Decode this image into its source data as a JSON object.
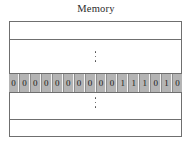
{
  "figure": {
    "title": "Memory",
    "caption_label": "Memory"
  },
  "memory": {
    "top_row_label": "",
    "bottom_row_label": "",
    "ellipsis_glyph": "⋮",
    "upper_ellipsis_label": "⋮",
    "lower_ellipsis_label": "⋮",
    "word": {
      "bit_count": 16,
      "bit_string": "0000000000111010",
      "bits": [
        "0",
        "0",
        "0",
        "0",
        "0",
        "0",
        "0",
        "0",
        "0",
        "0",
        "1",
        "1",
        "1",
        "0",
        "1",
        "0"
      ]
    }
  },
  "colors": {
    "page_background": "#ffffff",
    "box_border": "#6f6f6f",
    "word_highlight": "#b4b4b4",
    "bit_separator_light": "#f2f2f2",
    "bit_separator_dark": "#8d8d8d",
    "text": "#1a1a1a",
    "title_text": "#2b2b2b"
  }
}
